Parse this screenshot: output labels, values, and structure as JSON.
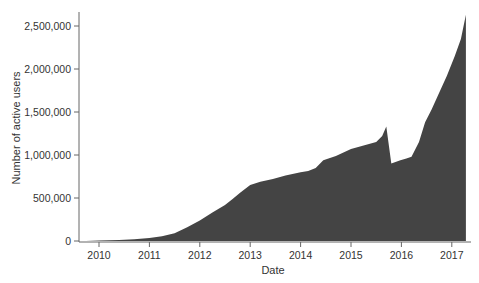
{
  "chart_data": {
    "type": "area",
    "title": "",
    "xlabel": "Date",
    "ylabel": "Number of active users",
    "xlim": [
      2009.6,
      2017.35
    ],
    "ylim": [
      0,
      2700000
    ],
    "grid": false,
    "legend": null,
    "fill_color": "#444444",
    "x_ticks": [
      2010,
      2011,
      2012,
      2013,
      2014,
      2015,
      2016,
      2017
    ],
    "x_tick_labels": [
      "2010",
      "2011",
      "2012",
      "2013",
      "2014",
      "2015",
      "2016",
      "2017"
    ],
    "y_ticks": [
      0,
      500000,
      1000000,
      1500000,
      2000000,
      2500000
    ],
    "y_tick_labels": [
      "0",
      "500,000",
      "1,000,000",
      "1,500,000",
      "2,000,000",
      "2,500,000"
    ],
    "x": [
      2009.74,
      2010.0,
      2010.4,
      2010.7,
      2011.0,
      2011.25,
      2011.5,
      2011.75,
      2012.0,
      2012.25,
      2012.5,
      2012.65,
      2012.8,
      2013.0,
      2013.2,
      2013.45,
      2013.7,
      2014.0,
      2014.15,
      2014.3,
      2014.45,
      2014.7,
      2015.0,
      2015.25,
      2015.5,
      2015.62,
      2015.7,
      2015.8,
      2015.98,
      2016.1,
      2016.2,
      2016.35,
      2016.47,
      2016.6,
      2016.77,
      2016.9,
      2017.06,
      2017.18,
      2017.28
    ],
    "values": [
      0,
      5000,
      10000,
      20000,
      35000,
      55000,
      90000,
      160000,
      240000,
      330000,
      420000,
      490000,
      560000,
      650000,
      690000,
      720000,
      760000,
      800000,
      815000,
      850000,
      940000,
      990000,
      1070000,
      1110000,
      1150000,
      1220000,
      1330000,
      900000,
      940000,
      960000,
      980000,
      1150000,
      1380000,
      1530000,
      1750000,
      1920000,
      2150000,
      2350000,
      2630000
    ]
  }
}
